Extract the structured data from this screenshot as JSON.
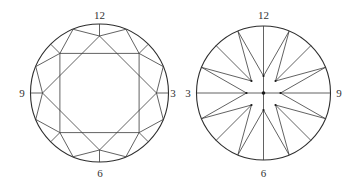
{
  "figure": {
    "panels": [
      {
        "id": "left",
        "description": "Round faceted diamond crown view with octagonal star pattern (square + rotated square)",
        "center": [
          99.5,
          93
        ],
        "radius": 69,
        "labels": {
          "top": "12",
          "right": "3",
          "bottom": "6",
          "left": "9"
        }
      },
      {
        "id": "right",
        "description": "Round faceted diamond pavilion view with 16-point star radiating from center",
        "center": [
          263.5,
          93
        ],
        "radius": 67,
        "labels": {
          "top": "12",
          "right": "9",
          "bottom": "6",
          "left": "3"
        }
      }
    ],
    "colors": {
      "line": "#3a3a3a",
      "text": "#333333",
      "background": "#ffffff"
    }
  }
}
